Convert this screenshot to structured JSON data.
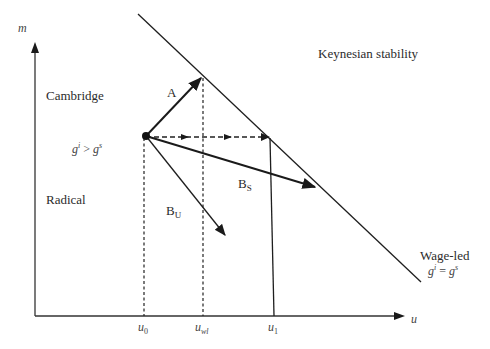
{
  "diagram": {
    "axes": {
      "y_label": "m",
      "x_label": "u"
    },
    "x_ticks": [
      {
        "base": "u",
        "sub": "0"
      },
      {
        "base": "u",
        "sub": "wl"
      },
      {
        "base": "u",
        "sub": "1"
      }
    ],
    "regions": {
      "top_left": "Cambridge",
      "bottom_left": "Radical",
      "top_right": "Keynesian stability"
    },
    "condition_left": {
      "a": "g",
      "a_sup": "i",
      "op": " > ",
      "b": "g",
      "b_sup": "s"
    },
    "line_label": "Wage-led",
    "condition_line": {
      "a": "g",
      "a_sup": "i",
      "op": " = ",
      "b": "g",
      "b_sup": "s"
    },
    "arrows": {
      "A": {
        "label": "A"
      },
      "BS": {
        "label": "B",
        "sub": "S"
      },
      "BU": {
        "label": "B",
        "sub": "U"
      }
    }
  }
}
